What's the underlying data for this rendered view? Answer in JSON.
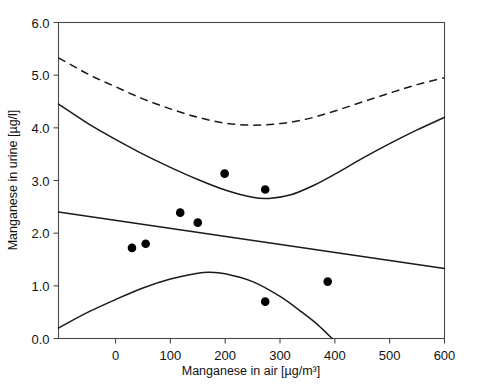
{
  "chart_data": {
    "type": "scatter",
    "title": "",
    "xlabel": "Manganese in air [µg/m³]",
    "ylabel": "Manganese in urine [µg/l]",
    "xlim": [
      -104,
      600
    ],
    "ylim": [
      0.0,
      6.0
    ],
    "xticks": [
      0,
      100,
      200,
      300,
      400,
      500,
      600
    ],
    "xtick_labels": [
      "0",
      "100",
      "200",
      "300",
      "400",
      "500",
      "600"
    ],
    "yticks": [
      0.0,
      1.0,
      2.0,
      3.0,
      4.0,
      5.0,
      6.0
    ],
    "ytick_labels": [
      "0.0",
      "1.0",
      "2.0",
      "3.0",
      "4.0",
      "5.0",
      "6.0"
    ],
    "grid": false,
    "legend": null,
    "points": [
      {
        "x": 30,
        "y": 1.72
      },
      {
        "x": 55,
        "y": 1.8
      },
      {
        "x": 118,
        "y": 2.39
      },
      {
        "x": 150,
        "y": 2.2
      },
      {
        "x": 199,
        "y": 3.13
      },
      {
        "x": 273,
        "y": 2.83
      },
      {
        "x": 273,
        "y": 0.7
      },
      {
        "x": 387,
        "y": 1.08
      }
    ],
    "series": [
      {
        "name": "upper-prediction-band",
        "style": "dashed",
        "points": [
          {
            "x": -104,
            "y": 5.33
          },
          {
            "x": -50,
            "y": 5.02
          },
          {
            "x": 0,
            "y": 4.78
          },
          {
            "x": 50,
            "y": 4.55
          },
          {
            "x": 100,
            "y": 4.36
          },
          {
            "x": 150,
            "y": 4.2
          },
          {
            "x": 200,
            "y": 4.09
          },
          {
            "x": 250,
            "y": 4.05
          },
          {
            "x": 300,
            "y": 4.08
          },
          {
            "x": 350,
            "y": 4.17
          },
          {
            "x": 400,
            "y": 4.32
          },
          {
            "x": 450,
            "y": 4.49
          },
          {
            "x": 500,
            "y": 4.66
          },
          {
            "x": 550,
            "y": 4.82
          },
          {
            "x": 600,
            "y": 4.95
          }
        ]
      },
      {
        "name": "upper-confidence-band",
        "style": "solid",
        "points": [
          {
            "x": -104,
            "y": 4.45
          },
          {
            "x": -50,
            "y": 4.08
          },
          {
            "x": 0,
            "y": 3.78
          },
          {
            "x": 50,
            "y": 3.5
          },
          {
            "x": 100,
            "y": 3.25
          },
          {
            "x": 150,
            "y": 3.02
          },
          {
            "x": 200,
            "y": 2.82
          },
          {
            "x": 250,
            "y": 2.68
          },
          {
            "x": 280,
            "y": 2.66
          },
          {
            "x": 320,
            "y": 2.73
          },
          {
            "x": 360,
            "y": 2.9
          },
          {
            "x": 400,
            "y": 3.12
          },
          {
            "x": 450,
            "y": 3.42
          },
          {
            "x": 500,
            "y": 3.7
          },
          {
            "x": 550,
            "y": 3.96
          },
          {
            "x": 600,
            "y": 4.2
          }
        ]
      },
      {
        "name": "regression-line",
        "style": "solid",
        "points": [
          {
            "x": -104,
            "y": 2.4
          },
          {
            "x": 600,
            "y": 1.33
          }
        ]
      },
      {
        "name": "lower-confidence-band",
        "style": "solid",
        "points": [
          {
            "x": -104,
            "y": 0.2
          },
          {
            "x": -50,
            "y": 0.5
          },
          {
            "x": 0,
            "y": 0.74
          },
          {
            "x": 50,
            "y": 0.96
          },
          {
            "x": 100,
            "y": 1.13
          },
          {
            "x": 150,
            "y": 1.24
          },
          {
            "x": 170,
            "y": 1.26
          },
          {
            "x": 200,
            "y": 1.23
          },
          {
            "x": 250,
            "y": 1.08
          },
          {
            "x": 300,
            "y": 0.8
          },
          {
            "x": 340,
            "y": 0.5
          },
          {
            "x": 370,
            "y": 0.25
          },
          {
            "x": 395,
            "y": 0.0
          }
        ]
      }
    ]
  }
}
